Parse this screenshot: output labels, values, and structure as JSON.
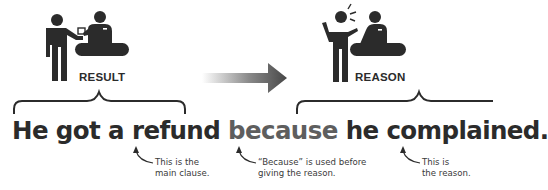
{
  "panels": {
    "left": {
      "label": "RESULT",
      "icon": "customer-receiving-refund-icon"
    },
    "right": {
      "label": "REASON",
      "icon": "customer-complaining-icon"
    },
    "arrow": {
      "icon": "arrow-right-icon",
      "gradient_from": "#ffffff",
      "gradient_to": "#4a4a4a"
    }
  },
  "sentence": {
    "main_clause": "He got a refund",
    "conjunction": "because",
    "reason_clause": "he complained.",
    "colors": {
      "main": "#2b2b2b",
      "conjunction": "#5e5e5e"
    }
  },
  "annotations": [
    {
      "line1": "This is the",
      "line2": "main clause."
    },
    {
      "line1": "“Because” is used before",
      "line2": "giving the reason."
    },
    {
      "line1": "This is",
      "line2": "the reason."
    }
  ]
}
